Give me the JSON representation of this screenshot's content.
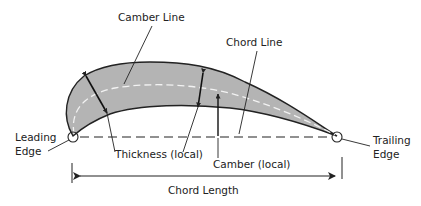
{
  "diagram": {
    "labels": {
      "camber_line": "Camber Line",
      "chord_line": "Chord Line",
      "leading_edge_1": "Leading",
      "leading_edge_2": "Edge",
      "trailing_edge_1": "Trailing",
      "trailing_edge_2": "Edge",
      "thickness": "Thickness (local)",
      "camber": "Camber (local)",
      "chord_length": "Chord Length"
    },
    "colors": {
      "airfoil_fill": "#b4b4b4",
      "outline": "#222222",
      "camber_line": "#f2f2f2",
      "background": "#ffffff"
    }
  }
}
